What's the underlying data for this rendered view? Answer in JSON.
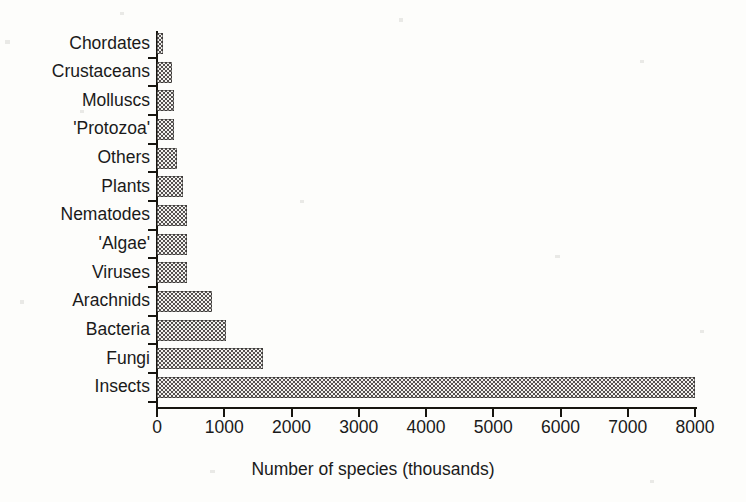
{
  "chart_data": {
    "type": "bar",
    "orientation": "horizontal",
    "title": "",
    "xlabel": "Number of species (thousands)",
    "ylabel": "",
    "xlim": [
      0,
      8000
    ],
    "xticks": [
      0,
      1000,
      2000,
      3000,
      4000,
      5000,
      6000,
      7000,
      8000
    ],
    "xticklabels": [
      "0",
      "1000",
      "2000",
      "3000",
      "4000",
      "5000",
      "6000",
      "7000",
      "8000"
    ],
    "grid": false,
    "legend": false,
    "bar_fill": "#555150",
    "bar_pattern": "checkerboard-dither",
    "categories": [
      "Chordates",
      "Crustaceans",
      "Molluscs",
      "'Protozoa'",
      "Others",
      "Plants",
      "Nematodes",
      "'Algae'",
      "Viruses",
      "Arachnids",
      "Bacteria",
      "Fungi",
      "Insects"
    ],
    "values": [
      90,
      220,
      250,
      260,
      300,
      380,
      440,
      450,
      450,
      820,
      1030,
      1580,
      8000
    ]
  }
}
